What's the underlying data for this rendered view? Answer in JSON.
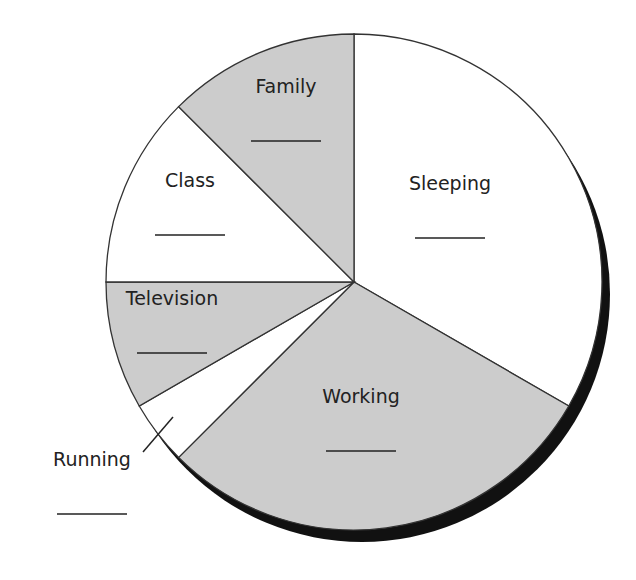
{
  "chart_data": {
    "type": "pie",
    "title": "",
    "unit": "hours of a day",
    "slices": [
      {
        "label": "Sleeping",
        "value": 8,
        "fill": "#ffffff"
      },
      {
        "label": "Working",
        "value": 7,
        "fill": "#cccccc"
      },
      {
        "label": "Running",
        "value": 1,
        "fill": "#ffffff"
      },
      {
        "label": "Television",
        "value": 2,
        "fill": "#cccccc"
      },
      {
        "label": "Class",
        "value": 3,
        "fill": "#ffffff"
      },
      {
        "label": "Family",
        "value": 3,
        "fill": "#cccccc"
      }
    ],
    "values_shown": false,
    "answer_blanks": true,
    "start_direction": "top",
    "direction": "clockwise",
    "shadow_color": "#111111",
    "outline_color": "#333333"
  }
}
